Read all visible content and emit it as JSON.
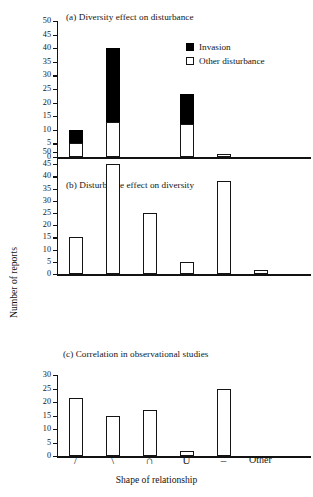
{
  "figure": {
    "ylabel": "Number of reports",
    "xlabel": "Shape of relationship",
    "categories": [
      "/",
      "\\",
      "∩",
      "U",
      "–",
      "Other"
    ]
  },
  "legend": {
    "position": "top-right-panel-a",
    "items": [
      {
        "name": "invasion",
        "label": "Invasion",
        "color": "#000000"
      },
      {
        "name": "other-disturbance",
        "label": "Other disturbance",
        "color": "#ffffff"
      }
    ]
  },
  "chart_data": [
    {
      "type": "bar",
      "panel": "a",
      "title": "(a) Diversity effect on disturbance",
      "stacked": true,
      "categories": [
        "/",
        "\\",
        "∩",
        "U",
        "–",
        "Other"
      ],
      "series": [
        {
          "name": "Other disturbance",
          "values": [
            5,
            13,
            0,
            12,
            1,
            0
          ],
          "color": "#ffffff"
        },
        {
          "name": "Invasion",
          "values": [
            5,
            27,
            0,
            11,
            0,
            0
          ],
          "color": "#000000"
        }
      ],
      "totals": [
        10,
        40,
        0,
        23,
        1,
        0
      ],
      "xlabel": "Shape of relationship",
      "ylabel": "Number of reports",
      "ylim": [
        0,
        50
      ],
      "yticks": [
        0,
        5,
        10,
        15,
        20,
        25,
        30,
        35,
        40,
        45,
        50
      ],
      "grid": false
    },
    {
      "type": "bar",
      "panel": "b",
      "title": "(b) Disturbance effect on diversity",
      "stacked": false,
      "categories": [
        "/",
        "\\",
        "∩",
        "U",
        "–",
        "Other"
      ],
      "series": [
        {
          "name": "Other disturbance",
          "values": [
            15,
            45,
            25,
            5,
            38,
            1.5
          ],
          "color": "#ffffff"
        }
      ],
      "xlabel": "Shape of relationship",
      "ylabel": "Number of reports",
      "ylim": [
        0,
        50
      ],
      "yticks": [
        0,
        5,
        10,
        15,
        20,
        25,
        30,
        35,
        40,
        45,
        50
      ],
      "grid": false
    },
    {
      "type": "bar",
      "panel": "c",
      "title": "(c) Correlation in observational studies",
      "stacked": false,
      "categories": [
        "/",
        "\\",
        "∩",
        "U",
        "–",
        "Other"
      ],
      "series": [
        {
          "name": "Other disturbance",
          "values": [
            21.5,
            15,
            17,
            2,
            25,
            0
          ],
          "color": "#ffffff"
        }
      ],
      "xlabel": "Shape of relationship",
      "ylabel": "Number of reports",
      "ylim": [
        0,
        30
      ],
      "yticks": [
        0,
        5,
        10,
        15,
        20,
        25,
        30
      ],
      "grid": false
    }
  ]
}
